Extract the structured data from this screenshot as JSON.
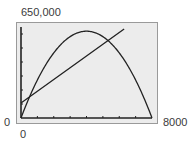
{
  "window": {
    "ymax_label": "650,000",
    "ymin_label": "0",
    "xmin_label": "0",
    "xmax_label": "8000",
    "xmin": 0,
    "xmax": 8000,
    "ymin": 0,
    "ymax": 650000,
    "xscl": 1000,
    "yscl": 100000
  },
  "colors": {
    "screen_bg": "#ececec",
    "frame": "#9a9a9a",
    "curve": "#222222",
    "axis": "#222222",
    "text": "#3a3a3a"
  },
  "chart_data": {
    "type": "line",
    "title": "",
    "xlabel": "",
    "ylabel": "",
    "xlim": [
      0,
      8000
    ],
    "ylim": [
      0,
      650000
    ],
    "x_ticks_every": 1000,
    "y_ticks_every": 100000,
    "grid": false,
    "legend": null,
    "series": [
      {
        "name": "parabola",
        "shape": "downward parabola",
        "formula_estimate": "y = 310x - 0.03875x^2",
        "x": [
          0,
          1000,
          2000,
          3000,
          4000,
          5000,
          6000,
          7000,
          8000
        ],
        "values": [
          0,
          271250,
          465000,
          581250,
          620000,
          581250,
          465000,
          271250,
          0
        ]
      },
      {
        "name": "line",
        "shape": "straight line",
        "formula_estimate": "y = 107000 + 84x",
        "x": [
          0,
          1000,
          2000,
          3000,
          4000,
          5000,
          6000,
          6300
        ],
        "values": [
          107000,
          191000,
          275000,
          359000,
          443000,
          527000,
          611000,
          636200
        ]
      }
    ],
    "annotations": [
      {
        "label": "intersection-1",
        "x": 430,
        "y": 143000
      },
      {
        "label": "intersection-2",
        "x": 5300,
        "y": 552000
      }
    ]
  }
}
